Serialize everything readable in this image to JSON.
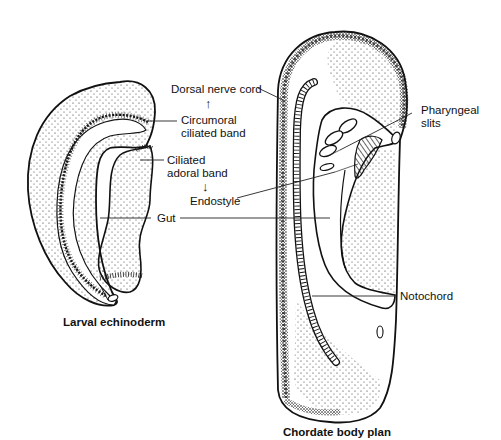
{
  "figure": {
    "panels": [
      {
        "id": "larval-echinoderm",
        "caption": "Larval echinoderm"
      },
      {
        "id": "chordate-body-plan",
        "caption": "Chordate body plan"
      }
    ],
    "labels": {
      "dorsal_nerve_cord": "Dorsal nerve cord",
      "circumoral_line1": "Circumoral",
      "circumoral_line2": "ciliated band",
      "ciliated_line1": "Ciliated",
      "ciliated_line2": "adoral band",
      "endostyle": "Endostyle",
      "gut": "Gut",
      "pharyngeal_line1": "Pharyngeal",
      "pharyngeal_line2": "slits",
      "notochord": "Notochord"
    },
    "arrows": {
      "up": "↑",
      "down": "↓"
    },
    "colors": {
      "ink": "#111111",
      "background": "#ffffff"
    }
  }
}
